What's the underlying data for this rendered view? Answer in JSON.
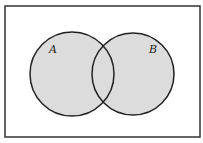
{
  "diagram": {
    "type": "venn",
    "universe": {
      "x": 5,
      "y": 6,
      "width": 195,
      "height": 131,
      "stroke": "#333333"
    },
    "sets": [
      {
        "label": "A",
        "cx": 72,
        "cy": 74,
        "r": 42,
        "fill": "#dcdcdc",
        "label_x": 49,
        "label_y": 53
      },
      {
        "label": "B",
        "cx": 133,
        "cy": 74,
        "r": 41,
        "fill": "#dcdcdc",
        "label_x": 149,
        "label_y": 53
      }
    ],
    "shaded_region": "A ∪ B"
  }
}
